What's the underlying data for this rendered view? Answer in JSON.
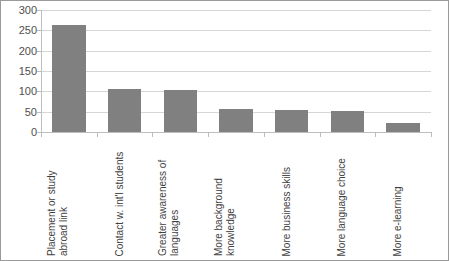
{
  "chart_data": {
    "type": "bar",
    "title": "",
    "xlabel": "",
    "ylabel": "",
    "categories": [
      "Placement or study abroad link",
      "Contact w. int'l students",
      "Greater awareness of languages",
      "More background knowledge",
      "More business skills",
      "More language choice",
      "More e-learning"
    ],
    "values": [
      262,
      105,
      104,
      57,
      54,
      52,
      23
    ],
    "ylim": [
      0,
      300
    ],
    "yticks": [
      0,
      50,
      100,
      150,
      200,
      250,
      300
    ],
    "ytick_labels": [
      "0",
      "50",
      "100",
      "150",
      "200",
      "250",
      "300"
    ],
    "grid": true,
    "legend": false,
    "series_color": "#808080"
  },
  "figure": {
    "border_color": "#9a9a9a",
    "gridline_color": "#d6d6d6",
    "axis_color": "#bdbdbd",
    "background": "#ffffff"
  }
}
